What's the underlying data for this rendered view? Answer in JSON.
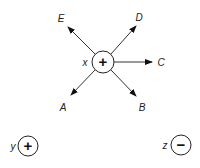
{
  "diagram": {
    "center_node": {
      "label": "x",
      "sign": "+"
    },
    "arrows": [
      {
        "target": "E"
      },
      {
        "target": "D"
      },
      {
        "target": "C"
      },
      {
        "target": "A"
      },
      {
        "target": "B"
      }
    ],
    "other_nodes": [
      {
        "label": "y",
        "sign": "+"
      },
      {
        "label": "z",
        "sign": "−"
      }
    ]
  }
}
